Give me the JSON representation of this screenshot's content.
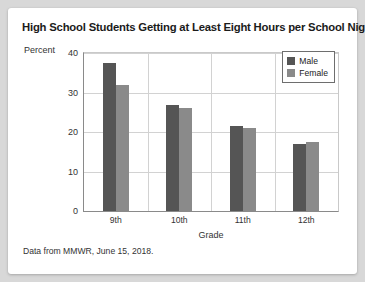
{
  "card": {
    "source_note": "Data from MMWR, June 15, 2018."
  },
  "legend": {
    "items": [
      {
        "label": "Male",
        "color": "#555555"
      },
      {
        "label": "Female",
        "color": "#8a8a8a"
      }
    ]
  },
  "chart_data": {
    "type": "bar",
    "title": "High School Students Getting at Least Eight Hours per School Night",
    "xlabel": "Grade",
    "ylabel": "Percent",
    "categories": [
      "9th",
      "10th",
      "11th",
      "12th"
    ],
    "series": [
      {
        "name": "Male",
        "color": "#555555",
        "values": [
          37.5,
          26.8,
          21.4,
          17.0
        ]
      },
      {
        "name": "Female",
        "color": "#8a8a8a",
        "values": [
          32.0,
          26.0,
          21.0,
          17.5
        ]
      }
    ],
    "ylim": [
      0,
      40
    ],
    "yticks": [
      0,
      10,
      20,
      30,
      40
    ],
    "ytick_labels": [
      "0",
      "10",
      "20",
      "30",
      "40"
    ],
    "grid": "horizontal-and-vertical-category-separators",
    "legend_position": "top-right-inside"
  }
}
